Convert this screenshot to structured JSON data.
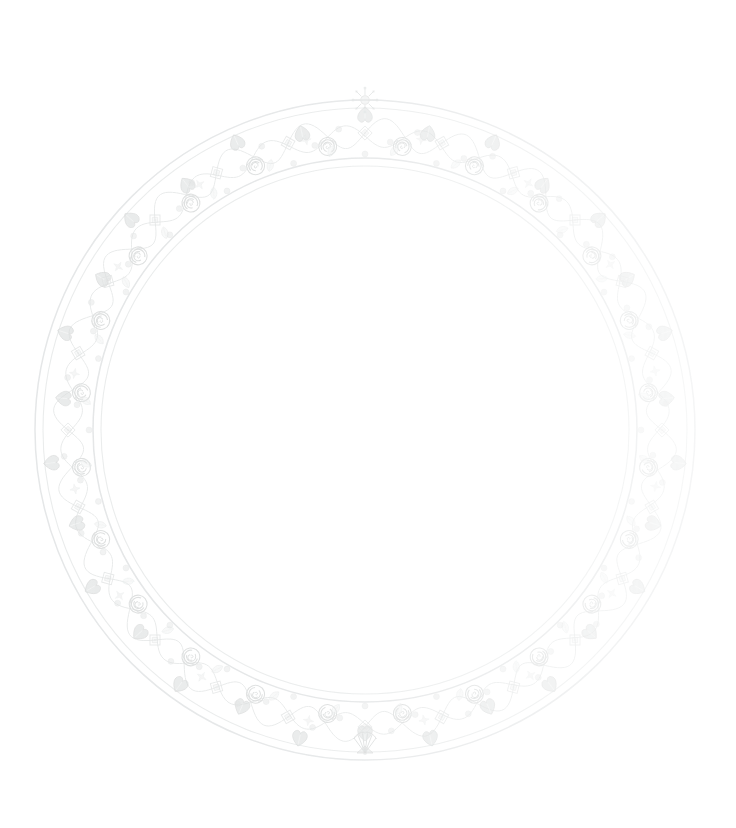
{
  "document": {
    "kind": "decorative-ornament",
    "subject": "circular floral wreath border",
    "background_color": "#ffffff",
    "width": 736,
    "height": 828
  },
  "wreath": {
    "name": "floral-wreath-border",
    "center_x": 365,
    "center_y": 430,
    "outer_radius": 330,
    "inner_radius": 263,
    "band_width": 67,
    "symmetry": "bilateral-vertical",
    "render_style": "very-faint-grayscale-watermark",
    "rings": [
      {
        "name": "outer-ring-line-1",
        "radius": 330,
        "stroke": "#e9ebec",
        "stroke_width": 1.4
      },
      {
        "name": "outer-ring-line-2",
        "radius": 322,
        "stroke": "#eceeef",
        "stroke_width": 1.1
      },
      {
        "name": "inner-ring-line-1",
        "radius": 272,
        "stroke": "#e7e9ea",
        "stroke_width": 1.4
      },
      {
        "name": "inner-ring-line-2",
        "radius": 264,
        "stroke": "#eceeef",
        "stroke_width": 1.1
      }
    ],
    "vine": {
      "name": "meandering-vine",
      "mean_radius": 297,
      "amplitude": 15,
      "waves": 24,
      "stroke": "#eceeee",
      "stroke_width": 1.0
    },
    "motifs": [
      {
        "name": "spiral-rose",
        "count": 24,
        "color": "#dcdede",
        "size": 13
      },
      {
        "name": "heart-leaf",
        "count": 30,
        "color": "#d9dbdb",
        "size": 12
      },
      {
        "name": "berry-dot",
        "count": 72,
        "color": "#e2e4e4",
        "size": 4
      },
      {
        "name": "star-accent",
        "count": 16,
        "color": "#e6e8e8",
        "size": 6
      },
      {
        "name": "leaf-sprig",
        "count": 28,
        "color": "#e8eaea",
        "size": 9
      }
    ],
    "apex_top": {
      "name": "top-apex-starburst-flower",
      "angle_deg": -90,
      "color": "#dfe1e1"
    },
    "apex_bottom": {
      "name": "bottom-apex-fan-flower",
      "angle_deg": 90,
      "color": "#dcdede"
    },
    "palette": {
      "darkest_mark": "#c8caca",
      "mid_mark": "#dcdede",
      "light_mark": "#ecedee",
      "faintest_mark": "#f5f6f6",
      "background": "#ffffff"
    },
    "fade": {
      "note": "left and top arcs render darker; right arc fades toward near-white",
      "left_opacity": 1.0,
      "right_opacity": 0.42
    }
  },
  "center_area": {
    "name": "empty-center",
    "content": "",
    "fill": "#ffffff"
  }
}
